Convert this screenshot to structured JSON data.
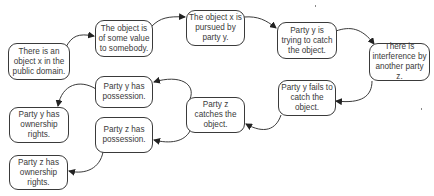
{
  "diagram": {
    "type": "flowchart",
    "nodes": [
      {
        "id": "n1",
        "label": "There is an object x in the public domain.",
        "x": 8,
        "y": 43,
        "w": 62,
        "h": 37
      },
      {
        "id": "n2",
        "label": "The object is of some value to somebody.",
        "x": 95,
        "y": 20,
        "w": 58,
        "h": 37
      },
      {
        "id": "n3",
        "label": "The object x is pursued by party y.",
        "x": 186,
        "y": 10,
        "w": 59,
        "h": 36
      },
      {
        "id": "n4",
        "label": "Party y is trying to catch the object.",
        "x": 277,
        "y": 22,
        "w": 60,
        "h": 37
      },
      {
        "id": "n5",
        "label": "There is interference by another party z.",
        "x": 369,
        "y": 43,
        "w": 61,
        "h": 38
      },
      {
        "id": "n6",
        "label": "Party y fails to catch the object.",
        "x": 278,
        "y": 80,
        "w": 58,
        "h": 36
      },
      {
        "id": "n7",
        "label": "Party z catches the object.",
        "x": 186,
        "y": 97,
        "w": 59,
        "h": 36
      },
      {
        "id": "n8",
        "label": "Party y has possession.",
        "x": 95,
        "y": 76,
        "w": 58,
        "h": 32
      },
      {
        "id": "n9",
        "label": "Party z has possession.",
        "x": 95,
        "y": 117,
        "w": 58,
        "h": 36
      },
      {
        "id": "n10",
        "label": "Party y has ownership rights.",
        "x": 9,
        "y": 107,
        "w": 60,
        "h": 36
      },
      {
        "id": "n11",
        "label": "Party z has ownership rights.",
        "x": 9,
        "y": 155,
        "w": 59,
        "h": 35
      }
    ],
    "edges": [
      {
        "from": "n1",
        "to": "n2"
      },
      {
        "from": "n2",
        "to": "n3"
      },
      {
        "from": "n3",
        "to": "n4"
      },
      {
        "from": "n4",
        "to": "n5"
      },
      {
        "from": "n5",
        "to": "n6"
      },
      {
        "from": "n6",
        "to": "n7"
      },
      {
        "from": "n7",
        "to": "n8"
      },
      {
        "from": "n7",
        "to": "n9"
      },
      {
        "from": "n8",
        "to": "n10"
      },
      {
        "from": "n9",
        "to": "n11"
      }
    ],
    "colors": {
      "stroke": "#3a3a3a",
      "background": "#ffffff",
      "text": "#3a3a3a"
    }
  }
}
